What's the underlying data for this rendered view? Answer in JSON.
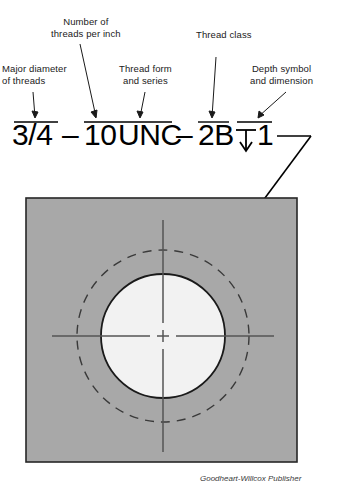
{
  "figure": {
    "type": "engineering-drawing",
    "callouts": [
      {
        "id": "major-diameter",
        "text": "Major diameter\nof threads",
        "points_to": "3/4"
      },
      {
        "id": "threads-per-inch",
        "text": "Number of\nthreads per inch",
        "points_to": "10"
      },
      {
        "id": "thread-form",
        "text": "Thread form\nand series",
        "points_to": "UNC"
      },
      {
        "id": "thread-class",
        "text": "Thread class",
        "points_to": "2B"
      },
      {
        "id": "depth-symbol",
        "text": "Depth symbol\nand dimension",
        "points_to": "depth 1"
      }
    ],
    "designation": {
      "major_diameter": "3/4",
      "dash_1": "–",
      "threads_per_inch": "10",
      "thread_form_series": "UNC",
      "dash_2": "–",
      "thread_class": "2B",
      "depth_symbol": "depth-arrow-symbol",
      "depth_value": "1",
      "full_text": "3/4 – 10UNC – 2B ↓ 1"
    },
    "hole_view": {
      "plate_fill": "#a8a8a8",
      "plate_border": "#262626",
      "minor_diameter_circle": "solid",
      "major_diameter_circle": "dashed",
      "hole_fill": "#f2f2f2",
      "centerlines": "crossing horizontal and vertical",
      "leader_arrow": "points to minor diameter circle"
    },
    "credit": "Goodheart-Willcox Publisher"
  }
}
